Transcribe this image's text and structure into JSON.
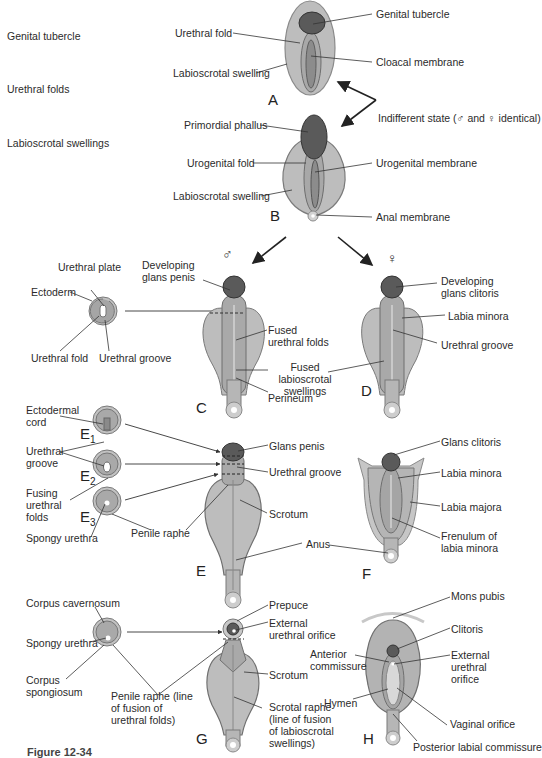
{
  "side_labels": [
    "Genital tubercle",
    "Urethral folds",
    "Labioscrotal swellings"
  ],
  "panels": {
    "A": "A",
    "B": "B",
    "C": "C",
    "D": "D",
    "E": "E",
    "F": "F",
    "G": "G",
    "H": "H",
    "E1": "E",
    "E2": "E",
    "E3": "E",
    "E1_sub": "1",
    "E2_sub": "2",
    "E3_sub": "3"
  },
  "symbols": {
    "male": "♂",
    "female": "♀"
  },
  "labels": {
    "A": {
      "genital_tubercle": "Genital tubercle",
      "urethral_fold": "Urethral fold",
      "cloacal_membrane": "Cloacal membrane",
      "labioscrotal_swelling": "Labioscrotal swelling"
    },
    "indifferent_state": "Indifferent state (♂ and ♀ identical)",
    "B": {
      "primordial_phallus": "Primordial phallus",
      "urogenital_fold": "Urogenital fold",
      "urogenital_membrane": "Urogenital membrane",
      "labioscrotal_swelling": "Labioscrotal swelling",
      "anal_membrane": "Anal membrane"
    },
    "C": {
      "urethral_plate": "Urethral plate",
      "ectoderm": "Ectoderm",
      "urethral_fold": "Urethral fold",
      "urethral_groove": "Urethral groove",
      "developing_glans_penis": "Developing glans penis",
      "fused_urethral_folds": "Fused urethral folds",
      "fused_labioscrotal_swellings": "Fused labioscrotal swellings",
      "perineum": "Perineum"
    },
    "D": {
      "developing_glans_clitoris": "Developing glans clitoris",
      "labia_minora": "Labia minora",
      "urethral_groove": "Urethral groove"
    },
    "E": {
      "ectodermal_cord": "Ectodermal cord",
      "urethral_groove_left": "Urethral groove",
      "fusing_urethral_folds": "Fusing urethral folds",
      "spongy_urethra": "Spongy urethra",
      "penile_raphe": "Penile raphe",
      "glans_penis": "Glans penis",
      "urethral_groove": "Urethral groove",
      "scrotum": "Scrotum",
      "anus": "Anus"
    },
    "F": {
      "glans_clitoris": "Glans clitoris",
      "labia_minora": "Labia minora",
      "labia_majora": "Labia majora",
      "frenulum": "Frenulum of labia minora"
    },
    "G": {
      "corpus_cavernosum": "Corpus cavernosum",
      "spongy_urethra": "Spongy urethra",
      "corpus_spongiosum": "Corpus spongiosum",
      "penile_raphe": "Penile raphe (line of fusion of urethral folds)",
      "prepuce": "Prepuce",
      "external_urethral_orifice": "External urethral orifice",
      "scrotum": "Scrotum",
      "scrotal_raphe": "Scrotal raphe (line of fusion of labioscrotal swellings)"
    },
    "H": {
      "mons_pubis": "Mons pubis",
      "clitoris": "Clitoris",
      "anterior_commissure": "Anterior commissure",
      "external_urethral_orifice": "External urethral orifice",
      "hymen": "Hymen",
      "vaginal_orifice": "Vaginal orifice",
      "posterior_labial_commissure": "Posterior labial commissure"
    }
  },
  "caption": "Figure 12-34",
  "colors": {
    "outer": "#b9b9b9",
    "outer_stroke": "#7a7a7a",
    "inner": "#a3a3a3",
    "dark": "#555555",
    "line": "#333333"
  }
}
